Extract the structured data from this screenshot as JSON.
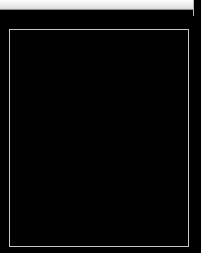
{
  "window": {
    "title": "Astronomical Image Viewer",
    "background_color": "#000000"
  },
  "toolbar": {
    "name": "toolbar-strip",
    "label": "",
    "background_color": "#ededed",
    "border_color": "#8f8f8f"
  },
  "canvas": {
    "name": "image-canvas",
    "label": "",
    "background_color": "#010101",
    "frame_color": "#c9c9c9",
    "frame_x": 9,
    "frame_y": 29,
    "frame_width": 180,
    "frame_height": 218
  },
  "objects": {
    "primary": {
      "name": "diffuse-astronomical-object",
      "label": "",
      "center_x": 98,
      "center_y": 135,
      "radius": 62,
      "peak_color": "#ffffff",
      "description": ""
    },
    "stars": [
      {
        "name": "faint-field-star",
        "label": "",
        "center_x": 68,
        "center_y": 88,
        "brightness": "faint"
      }
    ]
  }
}
